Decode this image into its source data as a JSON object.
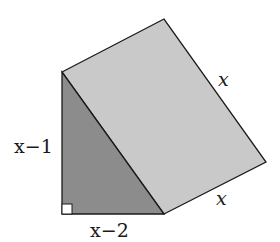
{
  "diagram": {
    "type": "triangular-prism",
    "colors": {
      "triangle_face": "#8c8c8c",
      "rect_face": "#c9c9c9",
      "stroke": "#1a1a1a",
      "right_angle_box": "#ffffff"
    },
    "labels": {
      "vertical_leg": "x−1",
      "horizontal_leg": "x−2",
      "depth_top": "x",
      "depth_bottom": "x"
    },
    "right_angle_marker": true
  }
}
